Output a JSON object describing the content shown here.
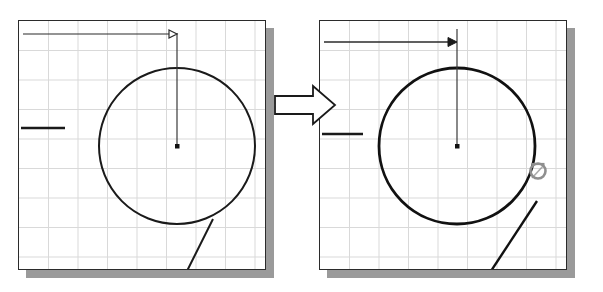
{
  "scene": {
    "title": "CAD circle tangent-constraint before/after illustration",
    "background_color": "#ffffff",
    "geometry_color": "#1a1a1a",
    "grid_color": "#d6d6d6",
    "frame_color": "#2b2b2b",
    "shadow_color": "#9a9a9a",
    "snap_marker_color": "#8c8c8c"
  },
  "panels": [
    {
      "id": "before",
      "name": "before-panel",
      "label": "Before",
      "frame": {
        "x": 18,
        "y": 20,
        "width": 248,
        "height": 250
      },
      "grid": {
        "spacing": 29.5,
        "color": "#d8d8d8",
        "visible": true
      },
      "circle": {
        "cx": 176,
        "cy": 145,
        "r": 78,
        "stroke_width": 2.0
      },
      "center_point": {
        "x": 176,
        "y": 145,
        "size": 4
      },
      "radius_line": {
        "x1": 176,
        "y1": 145,
        "x2": 176,
        "y2": 67
      },
      "dimension_line": {
        "x1": 22,
        "y1": 33,
        "x2": 172,
        "y2": 33,
        "arrowhead": "hollow",
        "extension_x": 176,
        "extension_y1": 27,
        "extension_y2": 72
      },
      "left_tick": {
        "x1": 20,
        "y1": 127,
        "x2": 64,
        "y2": 127
      },
      "tangent_line": {
        "x1": 212,
        "y1": 218,
        "x2": 186,
        "y2": 270
      },
      "snap_marker": {
        "visible": false,
        "x": 0,
        "y": 0,
        "r": 0
      }
    },
    {
      "id": "after",
      "name": "after-panel",
      "label": "After",
      "frame": {
        "x": 319,
        "y": 20,
        "width": 248,
        "height": 250
      },
      "grid": {
        "spacing": 29.5,
        "color": "#d8d8d8",
        "visible": true
      },
      "circle": {
        "cx": 456,
        "cy": 145,
        "r": 78,
        "stroke_width": 2.6
      },
      "center_point": {
        "x": 456,
        "y": 145,
        "size": 4
      },
      "radius_line": {
        "x1": 456,
        "y1": 145,
        "x2": 456,
        "y2": 52
      },
      "dimension_line": {
        "x1": 323,
        "y1": 41,
        "x2": 452,
        "y2": 41,
        "arrowhead": "solid",
        "extension_x": 456,
        "extension_y1": 28,
        "extension_y2": 70
      },
      "left_tick": {
        "x1": 321,
        "y1": 133,
        "x2": 362,
        "y2": 133
      },
      "tangent_line": {
        "x1": 536,
        "y1": 200,
        "x2": 490,
        "y2": 270
      },
      "snap_marker": {
        "visible": true,
        "x": 537,
        "y": 170,
        "r": 8,
        "type": "tangent-osnap"
      }
    }
  ],
  "transition_arrow": {
    "name": "transition-arrow",
    "label": "Transforms into",
    "x": 273,
    "y": 84,
    "width": 62,
    "height": 40,
    "fill": "#ffffff",
    "stroke": "#1a1a1a"
  }
}
